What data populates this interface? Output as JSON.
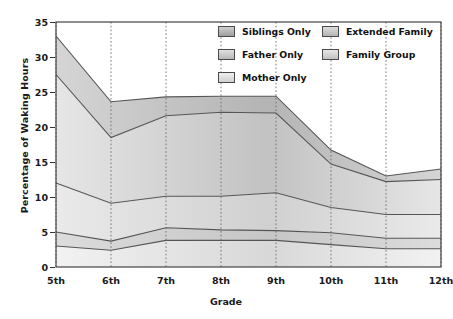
{
  "chart_data": {
    "type": "area",
    "title": "",
    "xlabel": "Grade",
    "ylabel": "Percentage of Waking Hours",
    "categories": [
      "5th",
      "6th",
      "7th",
      "8th",
      "9th",
      "10th",
      "11th",
      "12th"
    ],
    "ylim": [
      0,
      35
    ],
    "yticks": [
      0,
      5,
      10,
      15,
      20,
      25,
      30,
      35
    ],
    "grid": "vertical-dotted",
    "stacked": true,
    "legend_position": "top-right",
    "series": [
      {
        "name": "Family Group",
        "values": [
          3.0,
          2.4,
          3.8,
          3.8,
          3.8,
          3.2,
          2.6,
          2.6
        ]
      },
      {
        "name": "Extended Family",
        "values": [
          2.0,
          1.3,
          1.8,
          1.5,
          1.4,
          1.7,
          1.5,
          1.5
        ]
      },
      {
        "name": "Mother Only",
        "values": [
          7.0,
          5.4,
          4.5,
          4.8,
          5.4,
          3.6,
          3.4,
          3.4
        ]
      },
      {
        "name": "Father Only",
        "values": [
          15.5,
          9.4,
          11.5,
          12.0,
          11.4,
          6.2,
          4.7,
          5.0
        ]
      },
      {
        "name": "Siblings Only",
        "values": [
          5.5,
          5.1,
          2.7,
          2.3,
          2.4,
          2.0,
          0.8,
          1.5
        ]
      }
    ],
    "cumulative_tops": {
      "Family Group": [
        3.0,
        2.4,
        3.8,
        3.8,
        3.8,
        3.2,
        2.6,
        2.6
      ],
      "Extended Family": [
        5.0,
        3.7,
        5.6,
        5.3,
        5.2,
        4.9,
        4.1,
        4.1
      ],
      "Mother Only": [
        12.0,
        9.1,
        10.1,
        10.1,
        10.6,
        8.5,
        7.5,
        7.5
      ],
      "Father Only": [
        27.5,
        18.5,
        21.6,
        22.1,
        22.0,
        14.7,
        12.2,
        12.5
      ],
      "Siblings Only": [
        33.0,
        23.6,
        24.3,
        24.4,
        24.4,
        16.7,
        13.0,
        14.0
      ]
    }
  },
  "legend": {
    "left_column": [
      {
        "label": "Siblings Only"
      },
      {
        "label": "Father Only"
      },
      {
        "label": "Mother Only"
      }
    ],
    "right_column": [
      {
        "label": "Extended Family"
      },
      {
        "label": "Family Group"
      }
    ]
  },
  "axes": {
    "y_title": "Percentage of Waking Hours",
    "x_title": "Grade",
    "y_tick_labels": [
      "35",
      "30",
      "25",
      "20",
      "15",
      "10",
      "5",
      "0"
    ],
    "x_tick_labels": [
      "5th",
      "6th",
      "7th",
      "8th",
      "9th",
      "10th",
      "11th",
      "12th"
    ]
  },
  "colors": {
    "band_light": "#eeeeee",
    "band_mid": "#d2d2d2",
    "band_dark": "#b9b9b9",
    "outline": "#555555",
    "frame": "#444444",
    "text": "#111111"
  }
}
